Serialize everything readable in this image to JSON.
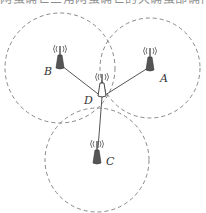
{
  "header": {
    "cropped_text": "网蛋确亡三角网蛋确亡的天确蛋部确作"
  },
  "diagram": {
    "colors": {
      "circle": "#888888",
      "link": "#555555",
      "tower": "#444444"
    },
    "nodes": [
      {
        "id": "A",
        "label": "A",
        "x": 150,
        "y": 62
      },
      {
        "id": "B",
        "label": "B",
        "x": 60,
        "y": 60
      },
      {
        "id": "C",
        "label": "C",
        "x": 97,
        "y": 155
      },
      {
        "id": "D",
        "label": "D",
        "x": 102,
        "y": 88
      }
    ],
    "coverage_circles": [
      {
        "node": "A",
        "cx": 150,
        "cy": 68,
        "r": 50
      },
      {
        "node": "B",
        "cx": 60,
        "cy": 68,
        "r": 55
      },
      {
        "node": "C",
        "cx": 97,
        "cy": 160,
        "r": 52
      }
    ],
    "links": [
      {
        "from": "D",
        "to": "A"
      },
      {
        "from": "D",
        "to": "B"
      },
      {
        "from": "D",
        "to": "C"
      }
    ]
  }
}
